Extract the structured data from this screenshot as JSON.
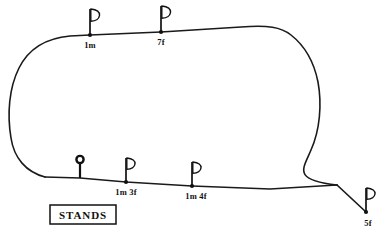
{
  "figure": {
    "kind": "racecourse-plan",
    "background_color": "#ffffff",
    "line_color": "#1a1a1a"
  },
  "stands": {
    "label": "STANDS"
  },
  "winning_post": {
    "name": "winning-post",
    "x": 80,
    "y": 178
  },
  "distance_markers": [
    {
      "id": "m-1m",
      "label": "1m",
      "x": 90,
      "y": 35,
      "label_x": 90,
      "label_y": 48,
      "flag_height": 26
    },
    {
      "id": "m-7f",
      "label": "7f",
      "x": 161,
      "y": 32,
      "label_x": 161,
      "label_y": 45,
      "flag_height": 26
    },
    {
      "id": "m-1m3f",
      "label": "1m 3f",
      "x": 126,
      "y": 182,
      "label_x": 126,
      "label_y": 195,
      "flag_height": 24
    },
    {
      "id": "m-1m4f",
      "label": "1m 4f",
      "x": 192,
      "y": 186,
      "label_x": 196,
      "label_y": 199,
      "flag_height": 24
    },
    {
      "id": "m-5f",
      "label": "5f",
      "x": 366,
      "y": 212,
      "label_x": 368,
      "label_y": 226,
      "flag_height": 24
    }
  ],
  "track": {
    "outline_path": "M 90 35 L 161 32 L 241 27 C 268 26 282 27 292 34 C 305 43 313 58 317 78 C 322 100 321 128 313 148 C 305 168 292 180 337 185 L 337 185 C 292 180 250 182 192 186 L 126 182 L 80 178 L 45 177 C 28 173 16 160 12 140 C 7 118 8 92 16 70 C 24 50 40 39 62 36 Z",
    "spur_path": "M 337 185 L 366 212"
  },
  "stands_box": {
    "x": 50,
    "y": 205,
    "width": 66,
    "height": 19,
    "text_x": 83,
    "text_y": 218
  }
}
